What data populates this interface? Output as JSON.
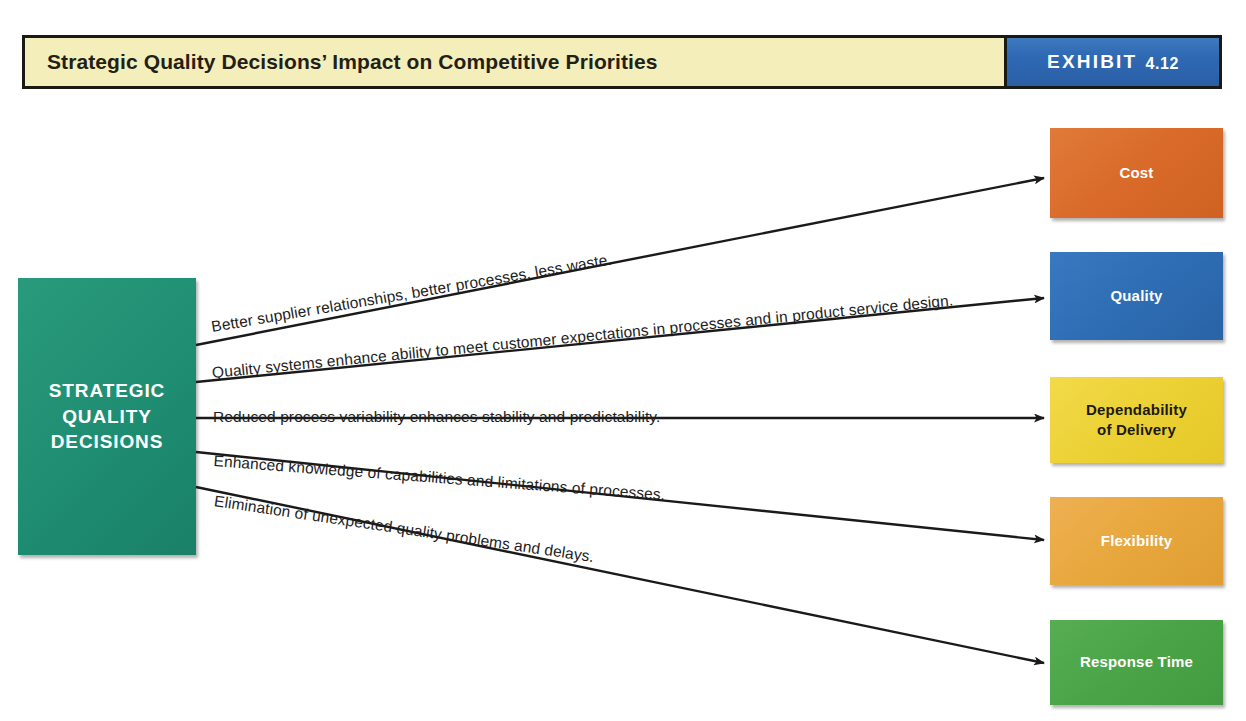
{
  "header": {
    "title": "Strategic Quality Decisions’ Impact on Competitive Priorities",
    "exhibit_label": "EXHIBIT",
    "exhibit_number": "4.12",
    "title_bg": "#f4eeba",
    "exhibit_bg": "#2f6ab4",
    "border_color": "#1a1a14"
  },
  "source": {
    "label": "STRATEGIC\nQUALITY\nDECISIONS",
    "color": "#219276",
    "text_color": "#ffffff"
  },
  "priorities": [
    {
      "label": "Cost",
      "color": "#d96a29",
      "text_color": "#ffffff"
    },
    {
      "label": "Quality",
      "color": "#2e6db4",
      "text_color": "#ffffff"
    },
    {
      "label": "Dependability\nof Delivery",
      "color": "#ecd134",
      "text_color": "#1c1a10"
    },
    {
      "label": "Flexibility",
      "color": "#e8a73c",
      "text_color": "#ffffff"
    },
    {
      "label": "Response Time",
      "color": "#4aa447",
      "text_color": "#ffffff"
    }
  ],
  "connections": [
    {
      "caption": "Better supplier relationships, better processes, less waste.",
      "target": "Cost"
    },
    {
      "caption": "Quality systems enhance ability to meet customer expectations in processes and in product service design.",
      "target": "Quality"
    },
    {
      "caption": "Reduced process variability enhances stability and predictability.",
      "target": "Dependability of Delivery"
    },
    {
      "caption": "Enhanced knowledge of capabilities and limitations of processes.",
      "target": "Flexibility"
    },
    {
      "caption": "Elimination of unexpected quality problems and delays.",
      "target": "Response Time"
    }
  ],
  "arrow_color": "#1a1a1a"
}
